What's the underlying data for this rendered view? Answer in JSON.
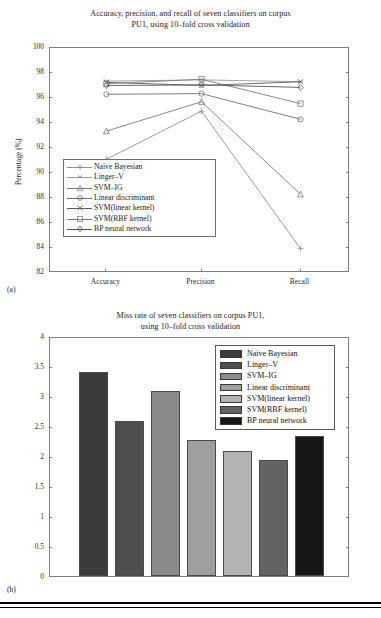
{
  "figure": {
    "panel_a_caption": "(a)",
    "panel_b_caption": "(b)"
  },
  "panel_a": {
    "title_line1": "Accuracy, precision, and recall of seven classifiers on corpus",
    "title_line2": "PU1, using 10–fold cross validation",
    "ylabel": "Percentage (%)"
  },
  "panel_b": {
    "title_line1": "Miss rate of seven classifiers on corpus PU1,",
    "title_line2": "using 10–fold cross validation",
    "ylabel": "Percentage (%)"
  },
  "chart_data": [
    {
      "type": "line",
      "title": "Accuracy, precision, and recall of seven classifiers on corpus PU1, using 10–fold cross validation",
      "xlabel": "",
      "ylabel": "Percentage (%)",
      "categories": [
        "Accuracy",
        "Precision",
        "Recall"
      ],
      "xticklabels": [
        "Accuracy",
        "Precision",
        "Recall"
      ],
      "yticklabels": [
        "82",
        "84",
        "86",
        "88",
        "90",
        "92",
        "94",
        "96",
        "98",
        "100"
      ],
      "ylim": [
        82,
        100
      ],
      "ytick_step": 2,
      "grid": false,
      "legend_position": "lower-left-inside",
      "series": [
        {
          "name": "Naïve Bayesian",
          "marker": "plus",
          "color": "#8f8f8f",
          "values": [
            91.1,
            94.95,
            83.95
          ]
        },
        {
          "name": "Linger–V",
          "marker": "star",
          "color": "#9a9a9a",
          "values": [
            97.35,
            97.45,
            97.3
          ]
        },
        {
          "name": "SVM–IG",
          "marker": "triangle",
          "color": "#7a7a7a",
          "values": [
            93.35,
            95.7,
            88.3
          ]
        },
        {
          "name": "Linear discriminant",
          "marker": "circle",
          "color": "#6f6f6f",
          "values": [
            96.3,
            96.35,
            94.3
          ]
        },
        {
          "name": "SVM(linear kernel)",
          "marker": "x",
          "color": "#5e5e5e",
          "values": [
            97.25,
            97.0,
            97.3
          ]
        },
        {
          "name": "SVM(RBF kernel)",
          "marker": "square",
          "color": "#7d7d7d",
          "values": [
            97.15,
            97.5,
            95.55
          ]
        },
        {
          "name": "BP neural network",
          "marker": "diamond",
          "color": "#555555",
          "values": [
            97.0,
            97.05,
            96.85
          ]
        }
      ]
    },
    {
      "type": "bar",
      "title": "Miss rate of seven classifiers on corpus PU1, using 10–fold cross validation",
      "xlabel": "",
      "ylabel": "Percentage (%)",
      "categories": [
        "Naive Bayesian",
        "Linger–V",
        "SVM–IG",
        "Linear discriminant",
        "SVM(linear kernel)",
        "SVM(RBF kernel)",
        "BP neural network"
      ],
      "values": [
        3.4,
        2.58,
        3.09,
        2.26,
        2.09,
        1.93,
        2.34
      ],
      "yticklabels": [
        "0",
        "0.5",
        "1",
        "1.5",
        "2",
        "2.5",
        "3",
        "3.5",
        "4"
      ],
      "ylim": [
        0,
        4
      ],
      "ytick_step": 0.5,
      "grid": false,
      "legend_position": "upper-right-inside",
      "bar_colors": [
        "#3b3b3b",
        "#4f4f4f",
        "#8a8a8a",
        "#9f9f9f",
        "#b3b3b3",
        "#636363",
        "#161616"
      ],
      "legend_entries": [
        {
          "label": "Naive Bayesian",
          "color": "#3b3b3b"
        },
        {
          "label": "Linger–V",
          "color": "#4f4f4f"
        },
        {
          "label": "SVM–IG",
          "color": "#8a8a8a"
        },
        {
          "label": "Linear discriminant",
          "color": "#9f9f9f"
        },
        {
          "label": "SVM(linear kernel)",
          "color": "#b3b3b3"
        },
        {
          "label": "SVM(RBF kernel)",
          "color": "#636363"
        },
        {
          "label": "BP neural network",
          "color": "#161616"
        }
      ]
    }
  ]
}
